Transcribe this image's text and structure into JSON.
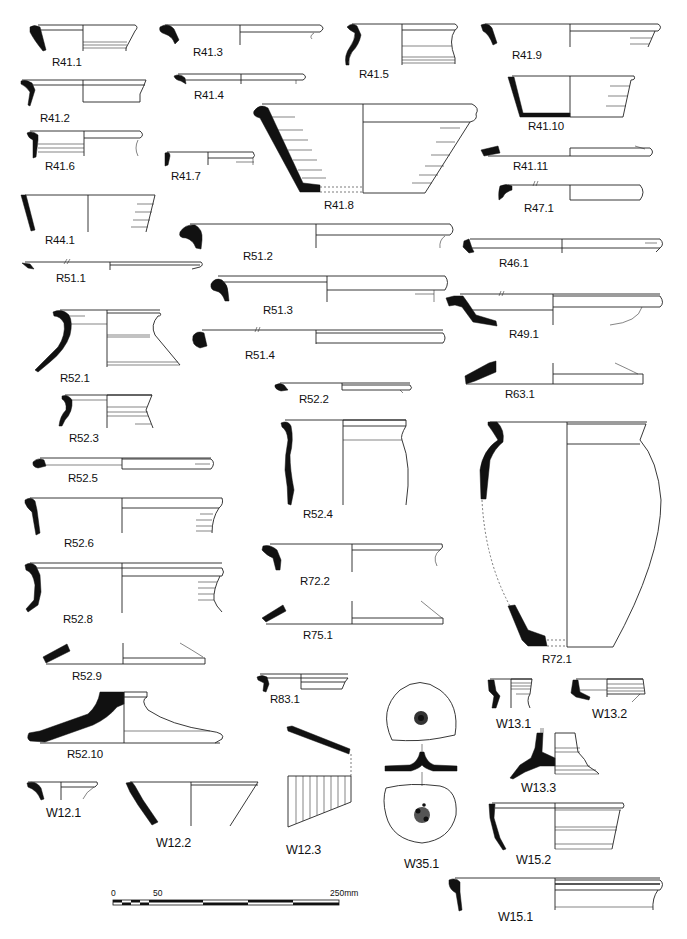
{
  "figure": {
    "type": "pottery-profile-plate",
    "background": "#ffffff",
    "ink": "#111111"
  },
  "vessels": [
    {
      "id": "R41.1",
      "label": "R41.1"
    },
    {
      "id": "R41.2",
      "label": "R41.2"
    },
    {
      "id": "R41.3",
      "label": "R41.3"
    },
    {
      "id": "R41.4",
      "label": "R41.4"
    },
    {
      "id": "R41.5",
      "label": "R41.5"
    },
    {
      "id": "R41.6",
      "label": "R41.6"
    },
    {
      "id": "R41.7",
      "label": "R41.7"
    },
    {
      "id": "R41.8",
      "label": "R41.8"
    },
    {
      "id": "R41.9",
      "label": "R41.9"
    },
    {
      "id": "R41.10",
      "label": "R41.10"
    },
    {
      "id": "R41.11",
      "label": "R41.11"
    },
    {
      "id": "R44.1",
      "label": "R44.1"
    },
    {
      "id": "R46.1",
      "label": "R46.1"
    },
    {
      "id": "R47.1",
      "label": "R47.1"
    },
    {
      "id": "R49.1",
      "label": "R49.1"
    },
    {
      "id": "R51.1",
      "label": "R51.1"
    },
    {
      "id": "R51.2",
      "label": "R51.2"
    },
    {
      "id": "R51.3",
      "label": "R51.3"
    },
    {
      "id": "R51.4",
      "label": "R51.4"
    },
    {
      "id": "R52.1",
      "label": "R52.1"
    },
    {
      "id": "R52.2",
      "label": "R52.2"
    },
    {
      "id": "R52.3",
      "label": "R52.3"
    },
    {
      "id": "R52.4",
      "label": "R52.4"
    },
    {
      "id": "R52.5",
      "label": "R52.5"
    },
    {
      "id": "R52.6",
      "label": "R52.6"
    },
    {
      "id": "R52.8",
      "label": "R52.8"
    },
    {
      "id": "R52.9",
      "label": "R52.9"
    },
    {
      "id": "R52.10",
      "label": "R52.10"
    },
    {
      "id": "R63.1",
      "label": "R63.1"
    },
    {
      "id": "R72.1",
      "label": "R72.1"
    },
    {
      "id": "R72.2",
      "label": "R72.2"
    },
    {
      "id": "R75.1",
      "label": "R75.1"
    },
    {
      "id": "R83.1",
      "label": "R83.1"
    },
    {
      "id": "W12.1",
      "label": "W12.1"
    },
    {
      "id": "W12.2",
      "label": "W12.2"
    },
    {
      "id": "W12.3",
      "label": "W12.3"
    },
    {
      "id": "W13.1",
      "label": "W13.1"
    },
    {
      "id": "W13.2",
      "label": "W13.2"
    },
    {
      "id": "W13.3",
      "label": "W13.3"
    },
    {
      "id": "W15.1",
      "label": "W15.1"
    },
    {
      "id": "W15.2",
      "label": "W15.2"
    },
    {
      "id": "W35.1",
      "label": "W35.1"
    }
  ],
  "scale_bar": {
    "start_label": "0",
    "mid_label": "50",
    "end_label": "250mm",
    "unit": "mm",
    "max": 250
  }
}
